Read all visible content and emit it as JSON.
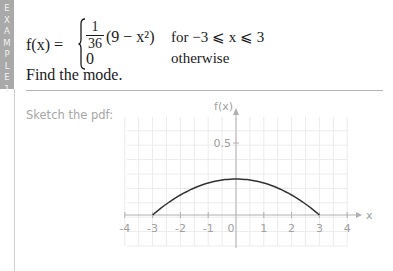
{
  "sidebar_tab": {
    "label": "EXAMPLE 1",
    "letters": [
      "E",
      "X",
      "A",
      "M",
      "P",
      "L",
      "E",
      "1"
    ],
    "color": "#a9a9a9"
  },
  "question": {
    "lhs": "f(x) =",
    "case1": {
      "fraction_numerator": "1",
      "fraction_denominator": "36",
      "expression": "(9 − x²)",
      "condition": "for −3 ⩽ x ⩽ 3"
    },
    "case2": {
      "value": "0",
      "condition": "otherwise"
    },
    "task": "Find the mode."
  },
  "sketch_prompt": "Sketch the pdf:",
  "chart_data": {
    "type": "line",
    "title": "",
    "xlabel": "x",
    "ylabel": "f(x)",
    "x_ticks": [
      -4,
      -3,
      -2,
      -1,
      0,
      1,
      2,
      3,
      4
    ],
    "x_tick_labels": [
      "-4",
      "-3",
      "-2",
      "-1",
      "0",
      "1",
      "2",
      "3",
      "4"
    ],
    "y_ticks": [
      0.5
    ],
    "y_tick_labels": [
      "0.5"
    ],
    "xlim": [
      -4.3,
      4.6
    ],
    "ylim": [
      -0.25,
      0.68
    ],
    "grid": true,
    "series": [
      {
        "name": "f(x) = (1/36)(9 − x²)",
        "x": [
          -3,
          -2.5,
          -2,
          -1.5,
          -1,
          -0.5,
          0,
          0.5,
          1,
          1.5,
          2,
          2.5,
          3
        ],
        "y": [
          0,
          0.076,
          0.139,
          0.188,
          0.222,
          0.243,
          0.25,
          0.243,
          0.222,
          0.188,
          0.139,
          0.076,
          0
        ]
      }
    ]
  }
}
